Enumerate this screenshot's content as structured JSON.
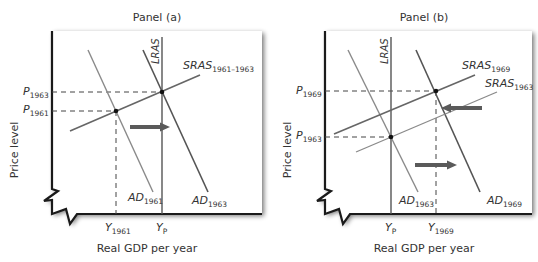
{
  "panels": [
    {
      "id": "a",
      "title": "Panel (a)",
      "ylabel": "Price level",
      "xlabel": "Real GDP per year",
      "lras_label": "LRAS",
      "curves": [
        {
          "key": "sras",
          "label": "SRAS",
          "sub": "1961–1963",
          "kind": "sras"
        },
        {
          "key": "ad1961",
          "label": "AD",
          "sub": "1961",
          "kind": "ad-old"
        },
        {
          "key": "ad1963",
          "label": "AD",
          "sub": "1963",
          "kind": "ad-new"
        }
      ],
      "y_ticks": [
        {
          "label": "P",
          "sub": "1963"
        },
        {
          "label": "P",
          "sub": "1961"
        }
      ],
      "x_ticks": [
        {
          "label": "Y",
          "sub": "1961"
        },
        {
          "label": "Y",
          "sub": "P"
        }
      ],
      "arrows": [
        {
          "direction": "right",
          "meaning": "AD shifts right"
        }
      ]
    },
    {
      "id": "b",
      "title": "Panel (b)",
      "ylabel": "Price level",
      "xlabel": "Real GDP per year",
      "lras_label": "LRAS",
      "curves": [
        {
          "key": "sras1969",
          "label": "SRAS",
          "sub": "1969",
          "kind": "sras-new"
        },
        {
          "key": "sras1963",
          "label": "SRAS",
          "sub": "1963",
          "kind": "sras-old"
        },
        {
          "key": "ad1963",
          "label": "AD",
          "sub": "1963",
          "kind": "ad-old"
        },
        {
          "key": "ad1969",
          "label": "AD",
          "sub": "1969",
          "kind": "ad-new"
        }
      ],
      "y_ticks": [
        {
          "label": "P",
          "sub": "1969"
        },
        {
          "label": "P",
          "sub": "1963"
        }
      ],
      "x_ticks": [
        {
          "label": "Y",
          "sub": "P"
        },
        {
          "label": "Y",
          "sub": "1969"
        }
      ],
      "arrows": [
        {
          "direction": "left",
          "meaning": "SRAS shifts left"
        },
        {
          "direction": "right",
          "meaning": "AD shifts right"
        }
      ]
    }
  ],
  "colors": {
    "frame": "#1a1a1a",
    "lras": "#555555",
    "curve_dark": "#555555",
    "curve_light": "#8a8a8a",
    "arrow": "#5a5a5a",
    "dashed": "#444444",
    "text": "#333333"
  }
}
